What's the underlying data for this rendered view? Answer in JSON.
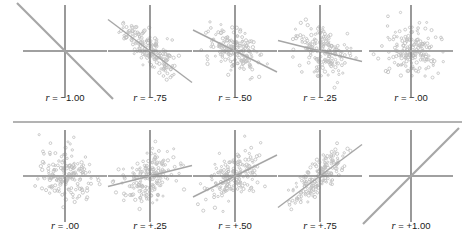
{
  "figure": {
    "background_color": "#ffffff",
    "axis_color": "#808080",
    "line_color": "#a6a6a6",
    "point_color": "#bfbfbf",
    "divider_color": "#9a9a9a",
    "label_color": "#1a1a1a",
    "r_symbol": "r",
    "equals": " = "
  },
  "chart_data": {
    "type": "scatter",
    "xlabel": "",
    "ylabel": "",
    "grid": false,
    "legend": "none",
    "xlim": [
      -3,
      3
    ],
    "ylim": [
      -3,
      3
    ],
    "rows": 2,
    "columns": 5,
    "panels": [
      {
        "index": 0,
        "row": 0,
        "column": 0,
        "r": -1.0,
        "label": "r = −1.00",
        "label_value": "−1.00",
        "slope": -1.0,
        "n_points": 0,
        "cloud": "none",
        "line": "perfect-negative-diagonal"
      },
      {
        "index": 1,
        "row": 0,
        "column": 1,
        "r": -0.75,
        "label": "r = −.75",
        "label_value": "−.75",
        "slope": -0.75,
        "n_points": 170,
        "cloud": "tight-negative-ellipse",
        "line": "steep-negative"
      },
      {
        "index": 2,
        "row": 0,
        "column": 2,
        "r": -0.5,
        "label": "r = −.50",
        "label_value": "−.50",
        "slope": -0.5,
        "n_points": 170,
        "cloud": "moderate-negative-ellipse",
        "line": "moderate-negative"
      },
      {
        "index": 3,
        "row": 0,
        "column": 3,
        "r": -0.25,
        "label": "r = −.25",
        "label_value": "−.25",
        "slope": -0.25,
        "n_points": 170,
        "cloud": "near-circular",
        "line": "shallow-negative"
      },
      {
        "index": 4,
        "row": 0,
        "column": 4,
        "r": -0.0,
        "label": "r = −.00",
        "label_value": "−.00",
        "slope": 0.0,
        "n_points": 170,
        "cloud": "circular",
        "line": "flat"
      },
      {
        "index": 5,
        "row": 1,
        "column": 0,
        "r": 0.0,
        "label": "r = .00",
        "label_value": ".00",
        "slope": 0.0,
        "n_points": 170,
        "cloud": "circular",
        "line": "flat"
      },
      {
        "index": 6,
        "row": 1,
        "column": 1,
        "r": 0.25,
        "label": "r = +.25",
        "label_value": "+.25",
        "slope": 0.25,
        "n_points": 170,
        "cloud": "near-circular",
        "line": "shallow-positive"
      },
      {
        "index": 7,
        "row": 1,
        "column": 2,
        "r": 0.5,
        "label": "r = +.50",
        "label_value": "+.50",
        "slope": 0.5,
        "n_points": 170,
        "cloud": "moderate-positive-ellipse",
        "line": "moderate-positive"
      },
      {
        "index": 8,
        "row": 1,
        "column": 3,
        "r": 0.75,
        "label": "r = +.75",
        "label_value": "+.75",
        "slope": 0.75,
        "n_points": 170,
        "cloud": "tight-positive-ellipse",
        "line": "steep-positive"
      },
      {
        "index": 9,
        "row": 1,
        "column": 4,
        "r": 1.0,
        "label": "r = +1.00",
        "label_value": "+1.00",
        "slope": 1.0,
        "n_points": 0,
        "cloud": "none",
        "line": "perfect-positive-diagonal"
      }
    ]
  }
}
